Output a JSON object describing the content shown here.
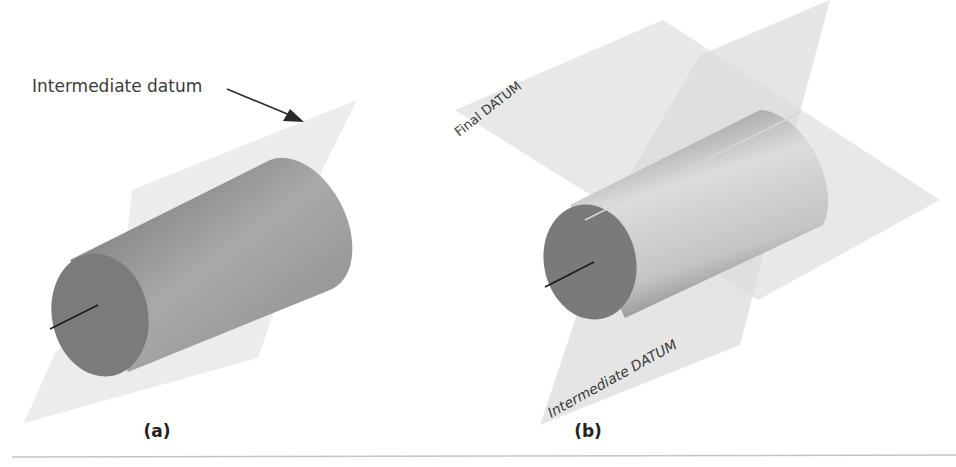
{
  "figure": {
    "panels": [
      {
        "id": "a",
        "caption": "(a)",
        "annotation": "Intermediate datum",
        "plane_labels": []
      },
      {
        "id": "b",
        "caption": "(b)",
        "annotation": "",
        "plane_labels": [
          "Final DATUM",
          "Intermediate DATUM"
        ]
      }
    ]
  },
  "colors": {
    "plane": "#e8e8e8",
    "cylinder_dark": "#7d7d7d",
    "cylinder_light": "#b8b8b8",
    "axis": "#1a1a1a",
    "rule": "#bdbdbd"
  }
}
